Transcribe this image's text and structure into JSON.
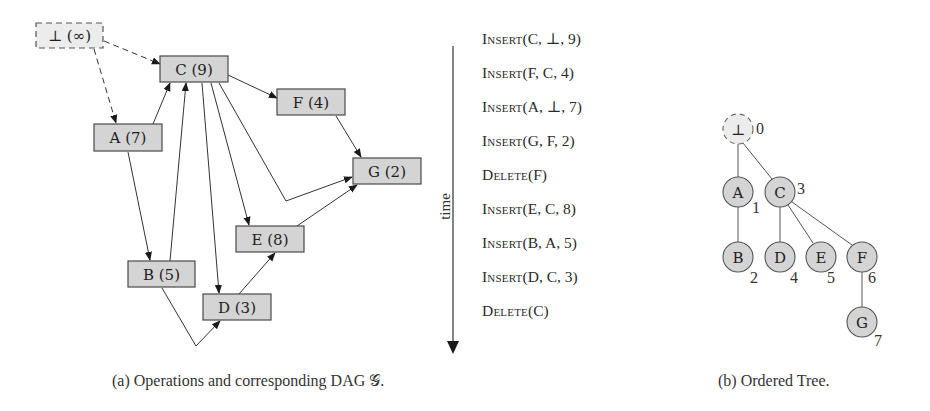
{
  "dag": {
    "root": {
      "label": "⊥",
      "value": "∞",
      "display": "⊥ (∞)",
      "style": "dashed"
    },
    "nodes": [
      {
        "id": "C",
        "display": "C (9)"
      },
      {
        "id": "F",
        "display": "F (4)"
      },
      {
        "id": "A",
        "display": "A (7)"
      },
      {
        "id": "G",
        "display": "G (2)"
      },
      {
        "id": "E",
        "display": "E (8)"
      },
      {
        "id": "B",
        "display": "B (5)"
      },
      {
        "id": "D",
        "display": "D (3)"
      }
    ],
    "edges": [
      {
        "from": "⊥",
        "to": "C",
        "style": "dashed"
      },
      {
        "from": "⊥",
        "to": "A",
        "style": "dashed"
      },
      {
        "from": "A",
        "to": "C"
      },
      {
        "from": "B",
        "to": "C"
      },
      {
        "from": "C",
        "to": "F"
      },
      {
        "from": "F",
        "to": "G"
      },
      {
        "from": "C",
        "to": "G"
      },
      {
        "from": "C",
        "to": "E"
      },
      {
        "from": "C",
        "to": "D"
      },
      {
        "from": "E",
        "to": "G"
      },
      {
        "from": "A",
        "to": "B"
      },
      {
        "from": "D",
        "to": "E"
      },
      {
        "from": "B",
        "to": "D"
      }
    ]
  },
  "timeline": {
    "axis_label": "time",
    "operations": [
      {
        "kw": "Insert",
        "args": "(C, ⊥, 9)"
      },
      {
        "kw": "Insert",
        "args": "(F, C, 4)"
      },
      {
        "kw": "Insert",
        "args": "(A, ⊥, 7)"
      },
      {
        "kw": "Insert",
        "args": "(G, F, 2)"
      },
      {
        "kw": "Delete",
        "args": "(F)"
      },
      {
        "kw": "Insert",
        "args": "(E, C, 8)"
      },
      {
        "kw": "Insert",
        "args": "(B, A, 5)"
      },
      {
        "kw": "Insert",
        "args": "(D, C, 3)"
      },
      {
        "kw": "Delete",
        "args": "(C)"
      }
    ]
  },
  "tree": {
    "nodes": [
      {
        "id": "⊥",
        "index": "0"
      },
      {
        "id": "A",
        "index": "1"
      },
      {
        "id": "B",
        "index": "2"
      },
      {
        "id": "C",
        "index": "3"
      },
      {
        "id": "D",
        "index": "4"
      },
      {
        "id": "E",
        "index": "5"
      },
      {
        "id": "F",
        "index": "6"
      },
      {
        "id": "G",
        "index": "7"
      }
    ]
  },
  "captions": {
    "a": "(a) Operations and corresponding DAG 𝒢.",
    "b": "(b) Ordered Tree."
  },
  "colors": {
    "node_fill": "#d4d4d4",
    "node_stroke": "#4a4a4a",
    "root_fill": "#ececec",
    "edge": "#333333"
  }
}
